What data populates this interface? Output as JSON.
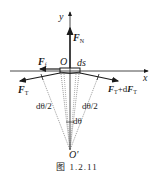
{
  "figure": {
    "caption": "图   1.2.11",
    "axes": {
      "x_label": "x",
      "y_label": "y"
    },
    "origin_label": "O",
    "center_label": "O'",
    "element_label": "ds",
    "forces": {
      "normal": {
        "symbol": "F",
        "sub": "N"
      },
      "friction": {
        "symbol": "F",
        "sub": "f"
      },
      "tension_left": {
        "symbol": "F",
        "sub": "T"
      },
      "tension_right": {
        "symbol": "F",
        "sub": "T",
        "plus": "+d",
        "symbol2": "F",
        "sub2": "T"
      }
    },
    "angles": {
      "half_left": "dθ/2",
      "half_right": "dθ/2",
      "full": "dθ"
    },
    "colors": {
      "ink": "#1a1a1a",
      "dotted": "#555555"
    }
  }
}
